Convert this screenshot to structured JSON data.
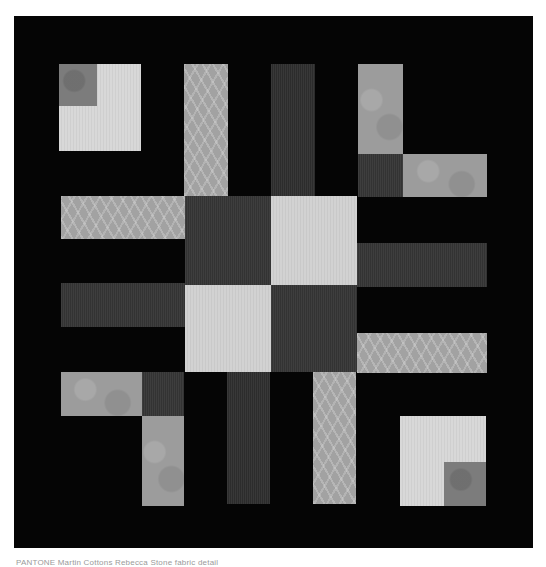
{
  "image": {
    "subject": "Patchwork quilt block on black background",
    "background_color": "#050505",
    "page_background": "#ffffff"
  },
  "palette": {
    "black": "#050505",
    "light_gray": "#d2d2d2",
    "mid_gray": "#9c9c9c",
    "dark_gray": "#3a3a3a"
  },
  "pieces": [
    {
      "name": "top-left-corner-block",
      "fabric": "light"
    },
    {
      "name": "top-left-corner-inner-square",
      "fabric": "batik-dark"
    },
    {
      "name": "top-stripe-left-swirl",
      "fabric": "swirl"
    },
    {
      "name": "top-stripe-center-dark",
      "fabric": "dark"
    },
    {
      "name": "top-right-L-vertical",
      "fabric": "batik"
    },
    {
      "name": "top-right-L-corner-dark",
      "fabric": "dark"
    },
    {
      "name": "top-right-L-horizontal",
      "fabric": "batik"
    },
    {
      "name": "left-row-top-swirl",
      "fabric": "swirl"
    },
    {
      "name": "left-row-middle-dark",
      "fabric": "dark"
    },
    {
      "name": "center-four-patch-top-left",
      "fabric": "dark"
    },
    {
      "name": "center-four-patch-top-right",
      "fabric": "light"
    },
    {
      "name": "center-four-patch-bottom-left",
      "fabric": "light"
    },
    {
      "name": "center-four-patch-bottom-right",
      "fabric": "dark"
    },
    {
      "name": "right-row-middle-dark",
      "fabric": "dark"
    },
    {
      "name": "right-row-bottom-swirl",
      "fabric": "swirl"
    },
    {
      "name": "bottom-left-L-horizontal",
      "fabric": "batik"
    },
    {
      "name": "bottom-left-L-corner-dark",
      "fabric": "dark"
    },
    {
      "name": "bottom-left-L-vertical",
      "fabric": "batik"
    },
    {
      "name": "bottom-stripe-center-dark",
      "fabric": "dark"
    },
    {
      "name": "bottom-stripe-right-swirl",
      "fabric": "swirl"
    },
    {
      "name": "bottom-right-corner-block",
      "fabric": "light"
    },
    {
      "name": "bottom-right-corner-inner-square",
      "fabric": "batik-dark"
    }
  ],
  "caption": {
    "text": "PANTONE  Martin Cottons  Rebecca Stone  fabric detail"
  }
}
